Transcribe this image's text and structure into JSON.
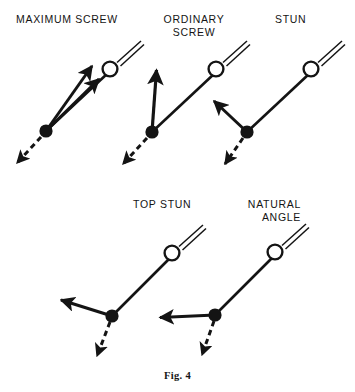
{
  "figure": {
    "caption": "Fig. 4",
    "background_color": "#ffffff",
    "ink_color": "#141414"
  },
  "labels": {
    "maximum_screw": "MAXIMUM SCREW",
    "ordinary_screw": "ORDINARY\nSCREW",
    "stun": "STUN",
    "top_stun": "TOP STUN",
    "natural_angle": "NATURAL\nANGLE"
  },
  "diagram_data": {
    "type": "diagram",
    "subject": "snooker cue ball deflection angles after contact",
    "legend_symbols": {
      "cue_ball": "hollow circle with double-line cue stick",
      "object_ball_contact_point": "filled black dot",
      "object_ball_path": "dashed arrow",
      "cue_ball_path_after_contact": "solid arrow"
    },
    "panels": [
      {
        "id": "maximum-screw",
        "label": "MAXIMUM SCREW",
        "cue_ball": {
          "cx": 110,
          "cy": 69,
          "r": 8
        },
        "cue_stick": {
          "x1": 118,
          "y1": 62,
          "x2": 142,
          "y2": 40
        },
        "contact_point": {
          "cx": 46,
          "cy": 131,
          "r": 6.5
        },
        "aim_line": {
          "x1": 46,
          "y1": 131,
          "x2": 104,
          "y2": 75
        },
        "cue_ball_arrows": [
          {
            "x1": 46,
            "y1": 131,
            "x2": 104,
            "y2": 74
          },
          {
            "x1": 46,
            "y1": 131,
            "x2": 96,
            "y2": 61
          }
        ],
        "object_ball_arrow": {
          "x1": 41,
          "y1": 137,
          "x2": 14,
          "y2": 166
        }
      },
      {
        "id": "ordinary-screw",
        "label": "ORDINARY SCREW",
        "cue_ball": {
          "cx": 216,
          "cy": 69,
          "r": 8
        },
        "cue_stick": {
          "x1": 224,
          "y1": 62,
          "x2": 248,
          "y2": 40
        },
        "contact_point": {
          "cx": 152,
          "cy": 132,
          "r": 6.5
        },
        "aim_line": {
          "x1": 152,
          "y1": 132,
          "x2": 210,
          "y2": 75
        },
        "cue_ball_arrows": [
          {
            "x1": 152,
            "y1": 132,
            "x2": 157,
            "y2": 64
          }
        ],
        "object_ball_arrow": {
          "x1": 147,
          "y1": 138,
          "x2": 120,
          "y2": 167
        }
      },
      {
        "id": "stun",
        "label": "STUN",
        "cue_ball": {
          "cx": 311,
          "cy": 69,
          "r": 8
        },
        "cue_stick": {
          "x1": 319,
          "y1": 62,
          "x2": 343,
          "y2": 40
        },
        "contact_point": {
          "cx": 247,
          "cy": 132,
          "r": 6.5
        },
        "aim_line": {
          "x1": 247,
          "y1": 132,
          "x2": 305,
          "y2": 75
        },
        "cue_ball_arrows": [
          {
            "x1": 247,
            "y1": 132,
            "x2": 209,
            "y2": 97
          }
        ],
        "object_ball_arrow": {
          "x1": 243,
          "y1": 138,
          "x2": 222,
          "y2": 167
        }
      },
      {
        "id": "top-stun",
        "label": "TOP STUN",
        "cue_ball": {
          "cx": 172,
          "cy": 253,
          "r": 8
        },
        "cue_stick": {
          "x1": 180,
          "y1": 246,
          "x2": 204,
          "y2": 224
        },
        "contact_point": {
          "cx": 112,
          "cy": 316,
          "r": 6.5
        },
        "aim_line": {
          "x1": 112,
          "y1": 316,
          "x2": 166,
          "y2": 259
        },
        "cue_ball_arrows": [
          {
            "x1": 112,
            "y1": 316,
            "x2": 56,
            "y2": 299
          }
        ],
        "object_ball_arrow": {
          "x1": 110,
          "y1": 322,
          "x2": 95,
          "y2": 360
        }
      },
      {
        "id": "natural-angle",
        "label": "NATURAL ANGLE",
        "cue_ball": {
          "cx": 275,
          "cy": 252,
          "r": 8
        },
        "cue_stick": {
          "x1": 283,
          "y1": 245,
          "x2": 307,
          "y2": 223
        },
        "contact_point": {
          "cx": 215,
          "cy": 315,
          "r": 6.5
        },
        "aim_line": {
          "x1": 215,
          "y1": 315,
          "x2": 269,
          "y2": 258
        },
        "cue_ball_arrows": [
          {
            "x1": 215,
            "y1": 315,
            "x2": 155,
            "y2": 318
          }
        ],
        "object_ball_arrow": {
          "x1": 214,
          "y1": 321,
          "x2": 200,
          "y2": 359
        }
      }
    ]
  }
}
